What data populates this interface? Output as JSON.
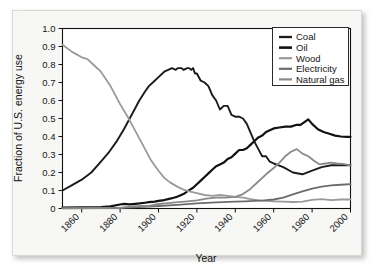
{
  "chart_data": {
    "type": "line",
    "title": "",
    "xlabel": "Year",
    "ylabel": "Fraction of U.S. energy use",
    "xlim": [
      1850,
      2000
    ],
    "ylim": [
      0,
      1.0
    ],
    "grid": false,
    "legend_position": "top-right",
    "xticks": [
      1860,
      1880,
      1900,
      1920,
      1940,
      1960,
      1980,
      2000
    ],
    "xtick_labels": [
      "1860",
      "1880",
      "1900",
      "1920",
      "1940",
      "1960",
      "1980",
      "2000"
    ],
    "yticks": [
      0,
      0.1,
      0.2,
      0.3,
      0.4,
      0.5,
      0.6,
      0.7,
      0.8,
      0.9,
      1.0
    ],
    "ytick_labels": [
      "0",
      "0.1",
      "0.2",
      "0.3",
      "0.4",
      "0.5",
      "0.6",
      "0.7",
      "0.8",
      "0.9",
      "1.0"
    ],
    "series": [
      {
        "name": "Coal",
        "color": "#1b1b1b",
        "width": 1.9,
        "x": [
          1850,
          1855,
          1860,
          1865,
          1870,
          1874,
          1878,
          1882,
          1885,
          1888,
          1890,
          1893,
          1895,
          1898,
          1900,
          1903,
          1905,
          1907,
          1909,
          1910,
          1912,
          1913,
          1915,
          1916,
          1917,
          1918,
          1919,
          1920,
          1922,
          1924,
          1926,
          1928,
          1930,
          1932,
          1934,
          1936,
          1938,
          1940,
          1942,
          1944,
          1946,
          1948,
          1950,
          1952,
          1954,
          1956,
          1958,
          1960,
          1965,
          1970,
          1975,
          1980,
          1985,
          1990,
          1995,
          2000
        ],
        "y": [
          0.1,
          0.13,
          0.16,
          0.2,
          0.26,
          0.31,
          0.37,
          0.44,
          0.5,
          0.56,
          0.6,
          0.65,
          0.68,
          0.71,
          0.73,
          0.76,
          0.77,
          0.78,
          0.77,
          0.78,
          0.78,
          0.77,
          0.78,
          0.78,
          0.77,
          0.78,
          0.75,
          0.75,
          0.71,
          0.7,
          0.68,
          0.63,
          0.6,
          0.55,
          0.57,
          0.57,
          0.52,
          0.51,
          0.51,
          0.5,
          0.47,
          0.42,
          0.37,
          0.33,
          0.29,
          0.29,
          0.26,
          0.25,
          0.23,
          0.2,
          0.19,
          0.21,
          0.23,
          0.24,
          0.24,
          0.24
        ]
      },
      {
        "name": "Oil",
        "color": "#111111",
        "width": 2.2,
        "x": [
          1850,
          1860,
          1870,
          1875,
          1880,
          1882,
          1885,
          1888,
          1890,
          1893,
          1895,
          1898,
          1900,
          1903,
          1905,
          1908,
          1910,
          1913,
          1915,
          1918,
          1920,
          1922,
          1924,
          1926,
          1928,
          1930,
          1932,
          1934,
          1936,
          1938,
          1940,
          1942,
          1944,
          1946,
          1948,
          1950,
          1952,
          1954,
          1956,
          1958,
          1960,
          1963,
          1966,
          1969,
          1972,
          1974,
          1976,
          1978,
          1980,
          1983,
          1986,
          1989,
          1992,
          1995,
          1998,
          2000
        ],
        "y": [
          0.005,
          0.006,
          0.008,
          0.012,
          0.022,
          0.026,
          0.023,
          0.026,
          0.028,
          0.032,
          0.035,
          0.038,
          0.042,
          0.047,
          0.052,
          0.06,
          0.067,
          0.08,
          0.095,
          0.115,
          0.135,
          0.155,
          0.175,
          0.195,
          0.215,
          0.235,
          0.245,
          0.255,
          0.275,
          0.285,
          0.305,
          0.325,
          0.325,
          0.335,
          0.355,
          0.375,
          0.395,
          0.405,
          0.425,
          0.435,
          0.445,
          0.45,
          0.455,
          0.455,
          0.465,
          0.465,
          0.48,
          0.495,
          0.47,
          0.44,
          0.425,
          0.415,
          0.405,
          0.4,
          0.398,
          0.398
        ]
      },
      {
        "name": "Wood",
        "color": "#9a9a9a",
        "width": 1.8,
        "x": [
          1850,
          1855,
          1860,
          1863,
          1866,
          1870,
          1875,
          1880,
          1885,
          1890,
          1893,
          1896,
          1900,
          1903,
          1906,
          1910,
          1913,
          1916,
          1920,
          1924,
          1928,
          1932,
          1936,
          1940,
          1944,
          1948,
          1952,
          1956,
          1960,
          1965,
          1970,
          1975,
          1980,
          1985,
          1990,
          1995,
          2000
        ],
        "y": [
          0.91,
          0.87,
          0.84,
          0.83,
          0.8,
          0.76,
          0.68,
          0.58,
          0.49,
          0.39,
          0.33,
          0.27,
          0.21,
          0.17,
          0.145,
          0.12,
          0.105,
          0.095,
          0.085,
          0.075,
          0.07,
          0.075,
          0.07,
          0.065,
          0.06,
          0.052,
          0.045,
          0.042,
          0.04,
          0.038,
          0.036,
          0.038,
          0.048,
          0.052,
          0.046,
          0.05,
          0.05
        ]
      },
      {
        "name": "Electricity",
        "color": "#6c6c6c",
        "width": 1.8,
        "x": [
          1850,
          1870,
          1880,
          1890,
          1900,
          1910,
          1920,
          1930,
          1940,
          1945,
          1950,
          1955,
          1960,
          1965,
          1970,
          1975,
          1980,
          1985,
          1990,
          1995,
          2000
        ],
        "y": [
          0.002,
          0.003,
          0.004,
          0.008,
          0.014,
          0.02,
          0.028,
          0.034,
          0.038,
          0.04,
          0.042,
          0.045,
          0.05,
          0.06,
          0.078,
          0.095,
          0.11,
          0.122,
          0.128,
          0.132,
          0.135
        ]
      },
      {
        "name": "Natural gas",
        "color": "#8a8a8a",
        "width": 1.8,
        "x": [
          1850,
          1870,
          1880,
          1885,
          1890,
          1895,
          1900,
          1905,
          1910,
          1915,
          1920,
          1925,
          1930,
          1935,
          1940,
          1944,
          1948,
          1952,
          1956,
          1960,
          1963,
          1966,
          1969,
          1972,
          1975,
          1978,
          1981,
          1984,
          1987,
          1990,
          1993,
          1996,
          2000
        ],
        "y": [
          0.001,
          0.002,
          0.004,
          0.01,
          0.015,
          0.014,
          0.025,
          0.03,
          0.035,
          0.04,
          0.045,
          0.055,
          0.06,
          0.06,
          0.065,
          0.08,
          0.11,
          0.15,
          0.19,
          0.225,
          0.255,
          0.29,
          0.315,
          0.33,
          0.305,
          0.29,
          0.265,
          0.245,
          0.25,
          0.255,
          0.25,
          0.248,
          0.24
        ]
      }
    ]
  },
  "legend": {
    "entries": [
      "Coal",
      "Oil",
      "Wood",
      "Electricity",
      "Natural gas"
    ]
  },
  "axes": {
    "y_title": "Fraction of U.S. energy use",
    "x_title": "Year"
  }
}
